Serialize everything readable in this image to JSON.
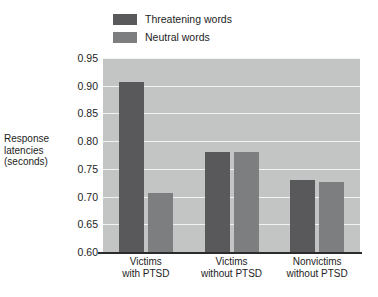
{
  "chart_data": {
    "type": "bar",
    "title": "",
    "xlabel": "",
    "ylabel": "Response latencies (seconds)",
    "ylabel_lines": [
      "Response",
      "latencies",
      "(seconds)"
    ],
    "categories": [
      "Victims with PTSD",
      "Victims without PTSD",
      "Nonvictims without PTSD"
    ],
    "category_lines": [
      [
        "Victims",
        "with PTSD"
      ],
      [
        "Victims",
        "without PTSD"
      ],
      [
        "Nonvictims",
        "without PTSD"
      ]
    ],
    "series": [
      {
        "name": "Threatening words",
        "values": [
          0.907,
          0.78,
          0.729
        ],
        "color": "#59595b"
      },
      {
        "name": "Neutral words",
        "values": [
          0.706,
          0.78,
          0.726
        ],
        "color": "#7d7e80"
      }
    ],
    "ylim": [
      0.6,
      0.95
    ],
    "ytick_labels": [
      "0.95",
      "0.90",
      "0.85",
      "0.80",
      "0.75",
      "0.70",
      "0.65",
      "0.60"
    ],
    "ytick_values": [
      0.95,
      0.9,
      0.85,
      0.8,
      0.75,
      0.7,
      0.65,
      0.6
    ],
    "grid": true,
    "legend_position": "top-left",
    "plot_background": "#c3c4c4",
    "gridline_color": "#f2f2f2",
    "axis_color": "#2b2b2b"
  },
  "legend": {
    "items": [
      {
        "label": "Threatening words",
        "color": "#59595b"
      },
      {
        "label": "Neutral words",
        "color": "#7d7e80"
      }
    ]
  }
}
